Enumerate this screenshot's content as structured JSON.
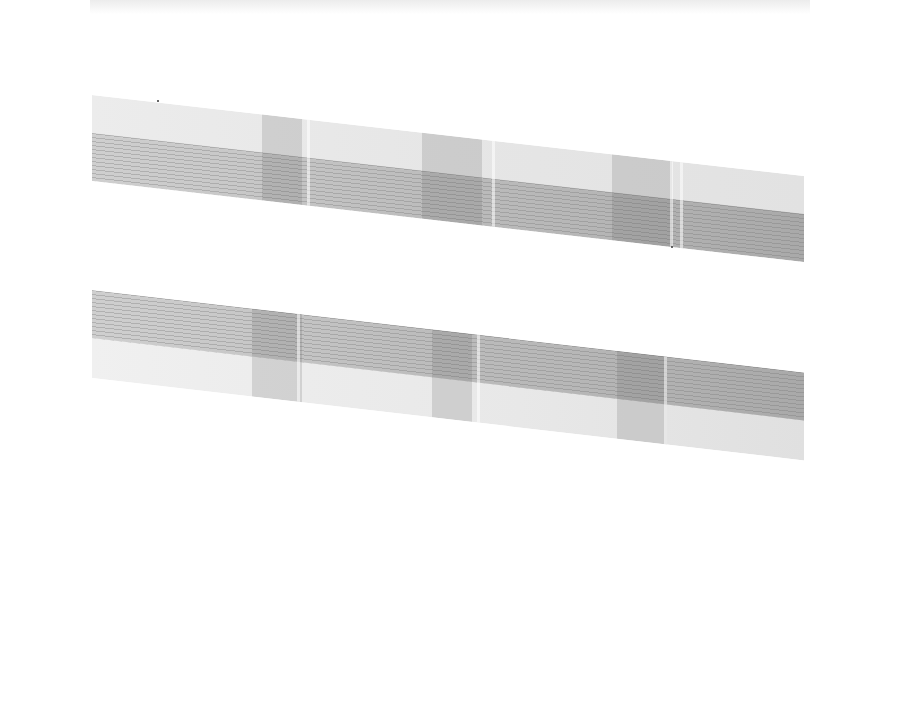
{
  "image": {
    "description": "Scanned film/gel with two slanted gray strips showing fine horizontal banding",
    "background_color": "#ffffff",
    "strips": [
      {
        "name": "upper-strip",
        "tone_light": "#ececec",
        "tone_dark": "#a9a9a9",
        "banded_region": "lower"
      },
      {
        "name": "lower-strip",
        "tone_light": "#ececec",
        "tone_dark": "#a9a9a9",
        "banded_region": "upper"
      }
    ]
  }
}
